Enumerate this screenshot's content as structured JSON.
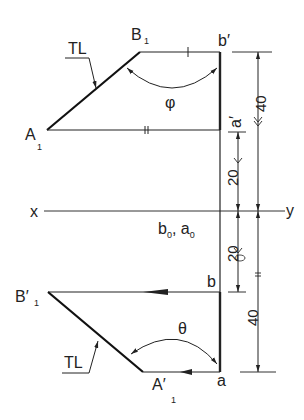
{
  "diagram": {
    "reference_line": {
      "left_label": "x",
      "right_label": "y"
    },
    "front_view": {
      "points": {
        "B1": {
          "main": "B",
          "sub": "1"
        },
        "b_prime": "b′",
        "A1": {
          "main": "A",
          "sub": "1"
        },
        "a_prime": "a′"
      },
      "true_length_label": "TL",
      "angle_label": "φ"
    },
    "top_view": {
      "points": {
        "B1_prime": {
          "main": "B′",
          "sub": "1"
        },
        "b": "b",
        "A1_prime": {
          "main": "A′",
          "sub": "1"
        },
        "a": "a"
      },
      "true_length_label": "TL",
      "angle_label": "θ"
    },
    "trace_label": {
      "b": "b",
      "b_sub": "0",
      "sep": ", ",
      "a": "a",
      "a_sub": "0"
    },
    "dimensions": {
      "upper_inner": "20",
      "upper_outer": "40",
      "lower_inner": "20",
      "lower_outer": "40"
    }
  },
  "colors": {
    "line": "#222222",
    "background": "#ffffff"
  }
}
